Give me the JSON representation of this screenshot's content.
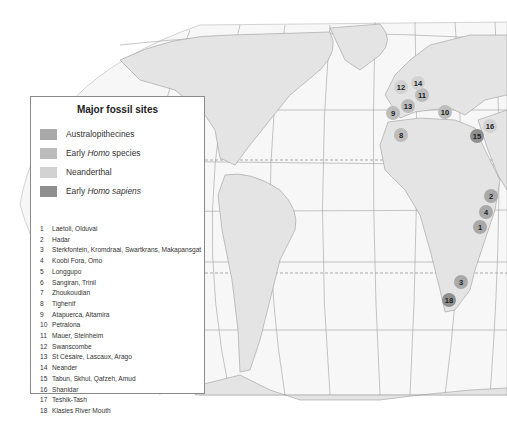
{
  "legend": {
    "title": "Major fossil sites",
    "categories": [
      {
        "label_pre": "Australopithecines",
        "label_em": "",
        "label_post": "",
        "color": "#a9a9a9"
      },
      {
        "label_pre": "Early ",
        "label_em": "Homo",
        "label_post": " species",
        "color": "#bcbcbc"
      },
      {
        "label_pre": "Neanderthal",
        "label_em": "",
        "label_post": "",
        "color": "#d2d2d2"
      },
      {
        "label_pre": "Early ",
        "label_em": "Homo sapiens",
        "label_post": "",
        "color": "#8f8f8f"
      }
    ],
    "sites": [
      {
        "num": "1",
        "name": "Laetoli, Olduvai"
      },
      {
        "num": "2",
        "name": "Hadar"
      },
      {
        "num": "3",
        "name": "Sterkfontein, Kromdraai, Swartkrans, Makapansgat"
      },
      {
        "num": "4",
        "name": "Koobi Fora, Omo"
      },
      {
        "num": "5",
        "name": "Longgupo"
      },
      {
        "num": "6",
        "name": "Sangiran, Trinil"
      },
      {
        "num": "7",
        "name": "Zhoukoudian"
      },
      {
        "num": "8",
        "name": "Tighenif"
      },
      {
        "num": "9",
        "name": "Atapuerca, Altamira"
      },
      {
        "num": "10",
        "name": "Petralona"
      },
      {
        "num": "11",
        "name": "Mauer, Steinheim"
      },
      {
        "num": "12",
        "name": "Swanscombe"
      },
      {
        "num": "13",
        "name": "St Césaire, Lascaux, Arago"
      },
      {
        "num": "14",
        "name": "Neander"
      },
      {
        "num": "15",
        "name": "Tabun, Skhul, Qafzeh, Amud"
      },
      {
        "num": "16",
        "name": "Shanidar"
      },
      {
        "num": "17",
        "name": "Teshik-Tash"
      },
      {
        "num": "18",
        "name": "Klasies River Mouth"
      }
    ]
  },
  "markers": [
    {
      "num": "1",
      "x": 480,
      "y": 227,
      "color": "#a9a9a9"
    },
    {
      "num": "2",
      "x": 491,
      "y": 196,
      "color": "#a9a9a9"
    },
    {
      "num": "3",
      "x": 461,
      "y": 282,
      "color": "#a9a9a9"
    },
    {
      "num": "4",
      "x": 486,
      "y": 212,
      "color": "#a9a9a9"
    },
    {
      "num": "8",
      "x": 401,
      "y": 135,
      "color": "#bcbcbc"
    },
    {
      "num": "9",
      "x": 393,
      "y": 113,
      "color": "#bcbcbc"
    },
    {
      "num": "10",
      "x": 445,
      "y": 112,
      "color": "#bcbcbc"
    },
    {
      "num": "11",
      "x": 422,
      "y": 95,
      "color": "#bcbcbc"
    },
    {
      "num": "12",
      "x": 401,
      "y": 87,
      "color": "#d2d2d2"
    },
    {
      "num": "13",
      "x": 408,
      "y": 106,
      "color": "#bcbcbc"
    },
    {
      "num": "14",
      "x": 418,
      "y": 83,
      "color": "#d2d2d2"
    },
    {
      "num": "15",
      "x": 477,
      "y": 136,
      "color": "#8f8f8f"
    },
    {
      "num": "16",
      "x": 490,
      "y": 126,
      "color": "#d2d2d2"
    },
    {
      "num": "18",
      "x": 449,
      "y": 300,
      "color": "#8f8f8f"
    }
  ],
  "map": {
    "top_longitude_labels": [
      "180°",
      "160°",
      "140°",
      "120°",
      "100°",
      "80°",
      "60°",
      "40°",
      "20°",
      "0°",
      "20°",
      "40°",
      "60°"
    ],
    "bottom_longitude_labels": [
      "160°",
      "140°",
      "120°",
      "100°",
      "80°",
      "60°",
      "40°",
      "20°",
      "0°",
      "20°",
      "40°"
    ],
    "latitude_labels": [
      "40°",
      "20°",
      "0°",
      "20°",
      "40°"
    ],
    "land_color": "#e6e6e6",
    "ocean_color": "#f6f6f6",
    "grid_color": "#9a9a9a"
  }
}
